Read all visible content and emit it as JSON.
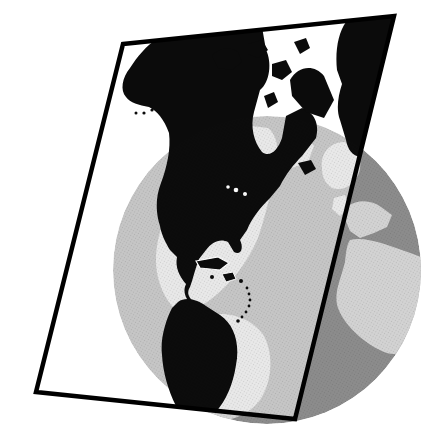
{
  "figure": {
    "kind": "map-projection-illustration",
    "colors": {
      "background": "#ffffff",
      "ocean": "#8c8c8c",
      "land": "#d3d3d3",
      "projected_land": "#0b0b0b",
      "plane_border": "#000000",
      "plane_tint": "#ffffff",
      "water_detail": "#ffffff"
    },
    "globe": {
      "cx": 267,
      "cy": 270,
      "r": 154
    },
    "elements": [
      "globe",
      "projection-plane",
      "projected-americas-silhouette",
      "globe-north-america",
      "globe-south-america",
      "globe-greenland",
      "europe-landmass",
      "africa-landmass",
      "arctic-islands",
      "caribbean-islands"
    ]
  }
}
